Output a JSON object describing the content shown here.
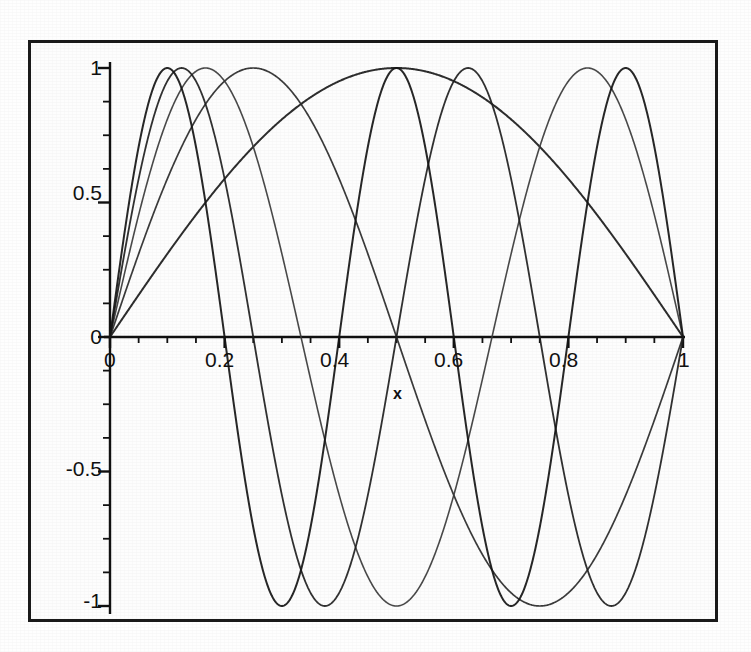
{
  "figure": {
    "background_color": "#fefefe",
    "frame_color": "#1a1a1a",
    "axis_color": "#111111"
  },
  "axis_titles": {
    "x": "x",
    "y": ""
  },
  "x_tick_labels": [
    "0",
    "0.2",
    "0.4",
    "0.6",
    "0.8",
    "1"
  ],
  "y_tick_labels": [
    "1",
    "0.5",
    "0",
    "-0.5",
    "-1"
  ],
  "chart_data": {
    "type": "line",
    "title": "",
    "xlabel": "x",
    "ylabel": "",
    "xlim": [
      0,
      1
    ],
    "ylim": [
      -1,
      1
    ],
    "grid": false,
    "legend": "none",
    "x_ticks": [
      0,
      0.2,
      0.4,
      0.6,
      0.8,
      1
    ],
    "y_ticks": [
      -1,
      -0.5,
      0,
      0.5,
      1
    ],
    "x_minor_tick_step": 0.05,
    "y_minor_tick_step": 0.125,
    "series": [
      {
        "name": "sin(1*pi*x)",
        "n": 1,
        "color": "#1b1b1b",
        "line_width": 2.0,
        "peaks_x": [
          0.5
        ],
        "troughs_x": [],
        "zeros_x": [
          0,
          1
        ]
      },
      {
        "name": "sin(2*pi*x)",
        "n": 2,
        "color": "#2a2a2a",
        "line_width": 1.7,
        "peaks_x": [
          0.25
        ],
        "troughs_x": [
          0.75
        ],
        "zeros_x": [
          0,
          0.5,
          1
        ]
      },
      {
        "name": "sin(3*pi*x)",
        "n": 3,
        "color": "#3a3a3a",
        "line_width": 1.6,
        "peaks_x": [
          0.1667,
          0.8333
        ],
        "troughs_x": [
          0.5
        ],
        "zeros_x": [
          0,
          0.3333,
          0.6667,
          1
        ]
      },
      {
        "name": "sin(4*pi*x)",
        "n": 4,
        "color": "#1f1f1f",
        "line_width": 1.8,
        "peaks_x": [
          0.125,
          0.625
        ],
        "troughs_x": [
          0.375,
          0.875
        ],
        "zeros_x": [
          0,
          0.25,
          0.5,
          0.75,
          1
        ]
      },
      {
        "name": "sin(5*pi*x)",
        "n": 5,
        "color": "#151515",
        "line_width": 2.0,
        "peaks_x": [
          0.1,
          0.5,
          0.9
        ],
        "troughs_x": [
          0.3,
          0.7
        ],
        "zeros_x": [
          0,
          0.2,
          0.4,
          0.6,
          0.8,
          1
        ]
      }
    ]
  },
  "geometry": {
    "plot_left_px": 110,
    "plot_right_px": 683,
    "axis_y_px": 337,
    "y_top_px": 68,
    "y_bottom_px": 606
  }
}
